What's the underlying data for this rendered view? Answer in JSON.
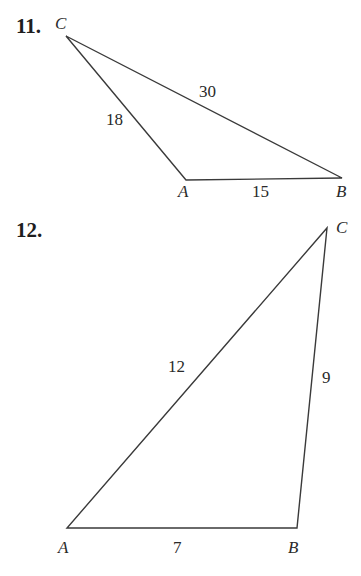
{
  "problems": [
    {
      "number": "11.",
      "vertices": {
        "A": "A",
        "B": "B",
        "C": "C"
      },
      "sides": {
        "CB": "30",
        "CA": "18",
        "AB": "15"
      }
    },
    {
      "number": "12.",
      "vertices": {
        "A": "A",
        "B": "B",
        "C": "C"
      },
      "sides": {
        "AC": "12",
        "BC": "9",
        "AB": "7"
      }
    }
  ],
  "colors": {
    "line": "#333333",
    "text": "#222222"
  }
}
